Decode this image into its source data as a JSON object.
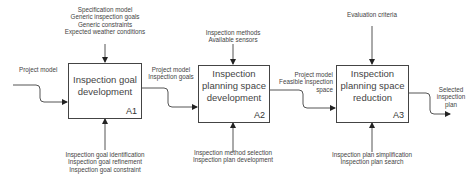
{
  "diagram": {
    "type": "IDEF0",
    "activities": [
      {
        "id": "A1",
        "title": "Inspection goal\ndevelopment",
        "controls": [
          "Specification model",
          "Generic inspection goals",
          "Generic constraints",
          "Expected weather conditions"
        ],
        "inputs": [
          "Project model"
        ],
        "outputs": [
          "Project model",
          "Inspection goals"
        ],
        "mechanisms": [
          "Inspection goal identification",
          "Inspection goal refinement",
          "Inspection goal constraint"
        ]
      },
      {
        "id": "A2",
        "title": "Inspection\nplanning space\ndevelopment",
        "controls": [
          "Inspection methods",
          "Available sensors"
        ],
        "outputs": [
          "Project model",
          "Feasible inspection",
          "space"
        ],
        "mechanisms": [
          "Inspection method selection",
          "Inspection plan development"
        ]
      },
      {
        "id": "A3",
        "title": "Inspection\nplanning space\nreduction",
        "controls": [
          "Evaluation criteria"
        ],
        "outputs": [
          "Selected",
          "inspection",
          "plan"
        ],
        "mechanisms": [
          "Inspection plan simplification",
          "Inspection plan search"
        ]
      }
    ]
  }
}
